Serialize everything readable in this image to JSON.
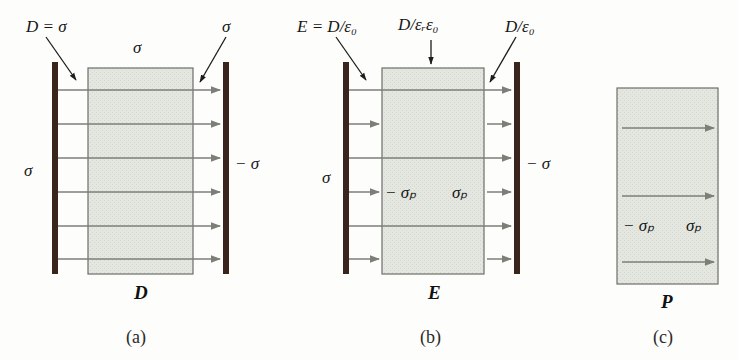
{
  "figure": {
    "title_visible": false,
    "background_color": "#fdfdfb",
    "panels": [
      {
        "id": "a",
        "caption": "(a)",
        "field_symbol": "D",
        "top_left_label": "D = σ",
        "top_center_label": "σ",
        "top_right_label": "σ",
        "left_plate_label": "σ",
        "right_plate_label": "− σ",
        "arrow_count": 6,
        "arrow_style": "continuous-plate-to-plate",
        "inner_labels": []
      },
      {
        "id": "b",
        "caption": "(b)",
        "field_symbol": "E",
        "top_left_label": "E = D/ε₀",
        "top_center_label": "D/εᵣε₀",
        "top_right_label": "D/ε₀",
        "left_plate_label": "σ",
        "right_plate_label": "− σ",
        "arrow_count": 6,
        "arrow_style": "alternating-continuous-and-gap-only",
        "inner_labels": [
          "− σₚ",
          "σₚ"
        ]
      },
      {
        "id": "c",
        "caption": "(c)",
        "field_symbol": "P",
        "top_left_label": "",
        "top_center_label": "",
        "top_right_label": "",
        "left_plate_label": "",
        "right_plate_label": "",
        "arrow_count": 3,
        "arrow_style": "inside-block-only",
        "inner_labels": [
          "− σₚ",
          "σₚ"
        ]
      }
    ],
    "colors": {
      "plate": "#3a241c",
      "dielectric_fill": "#e2e4de",
      "dielectric_border": "#6d6f69",
      "arrow": "#7c7e78",
      "pointer_arrow": "#1d1d1d",
      "text": "#161616"
    },
    "legend_notes": {
      "eps_0": "ε₀",
      "eps_r": "εᵣ",
      "sigma": "σ",
      "sigma_p": "σₚ"
    }
  }
}
